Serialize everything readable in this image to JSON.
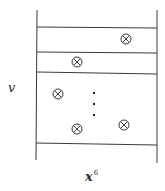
{
  "diagram": {
    "labels": {
      "vertical_axis": "v",
      "horizontal_axis_base": "x",
      "horizontal_axis_exponent": "6"
    },
    "frame": {
      "left_x": 37,
      "right_x": 157,
      "top_y": 10,
      "bottom_y": 161,
      "horizontal_lines_y": [
        27,
        52,
        72,
        144
      ]
    },
    "symbols": [
      {
        "type": "circle-cross",
        "x": 126,
        "y": 39
      },
      {
        "type": "circle-cross",
        "x": 77,
        "y": 62
      },
      {
        "type": "circle-cross",
        "x": 58,
        "y": 94
      },
      {
        "type": "circle-cross",
        "x": 77,
        "y": 129
      },
      {
        "type": "circle-cross",
        "x": 124,
        "y": 125
      }
    ],
    "ellipsis_dots": [
      {
        "x": 94,
        "y": 93
      },
      {
        "x": 94,
        "y": 104
      },
      {
        "x": 94,
        "y": 115
      }
    ],
    "colors": {
      "line": "#3a3a3a",
      "background": "#ffffff"
    }
  }
}
